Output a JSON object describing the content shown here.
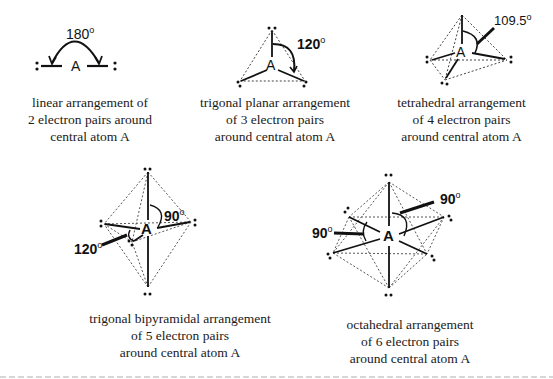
{
  "figure": {
    "central_atom": "A",
    "panels": [
      {
        "id": "linear",
        "angle_label": "180",
        "degree_symbol": "o",
        "caption_lines": [
          "linear arrangement of",
          "2 electron pairs around",
          "central atom A"
        ]
      },
      {
        "id": "trigonal-planar",
        "angle_label": "120",
        "degree_symbol": "o",
        "caption_lines": [
          "trigonal planar arrangement",
          "of 3 electron pairs",
          "around central atom A"
        ]
      },
      {
        "id": "tetrahedral",
        "angle_label": "109.5",
        "degree_symbol": "o",
        "caption_lines": [
          "tetrahedral arrangement",
          "of 4 electron pairs",
          "around central atom A"
        ]
      },
      {
        "id": "trigonal-bipyramidal",
        "angle_labels": [
          "90",
          "120"
        ],
        "degree_symbol": "o",
        "caption_lines": [
          "trigonal bipyramidal arrangement",
          "of 5 electron pairs",
          "around central atom A"
        ]
      },
      {
        "id": "octahedral",
        "angle_labels": [
          "90",
          "90"
        ],
        "degree_symbol": "o",
        "caption_lines": [
          "octahedral arrangement",
          "of 6 electron pairs",
          "around central atom A"
        ]
      }
    ]
  }
}
